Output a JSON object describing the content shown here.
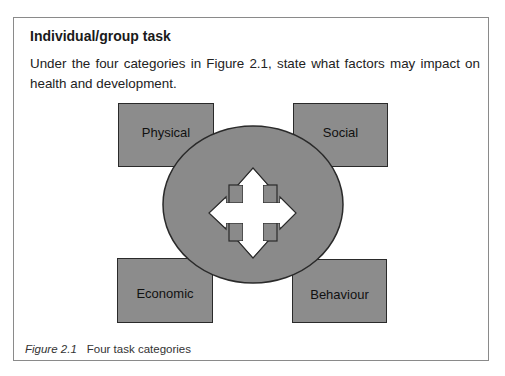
{
  "task": {
    "title": "Individual/group task",
    "instruction": "Under the four categories in Figure 2.1, state what factors may impact on health and development."
  },
  "figure": {
    "categories": [
      {
        "label": "Physical",
        "position": "top-left"
      },
      {
        "label": "Social",
        "position": "top-right"
      },
      {
        "label": "Economic",
        "position": "bottom-left"
      },
      {
        "label": "Behaviour",
        "position": "bottom-right"
      }
    ],
    "center_icon": "four-way-arrow-icon",
    "colors": {
      "box_fill": "#8c8c8c",
      "ellipse_fill": "#8a8a8a",
      "outline": "#2a2a2a",
      "arrow_fill": "#ffffff"
    },
    "caption_number": "Figure 2.1",
    "caption_text": "Four task categories"
  }
}
